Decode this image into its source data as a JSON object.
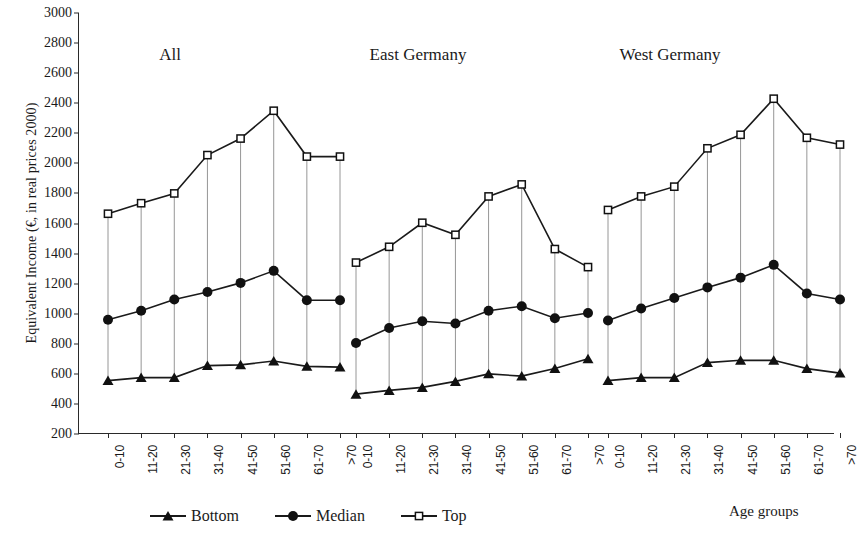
{
  "chart_data": {
    "type": "line",
    "title": "",
    "xlabel": "Age groups",
    "ylabel": "Equivalent Income (€, in real prices 2000)",
    "ylim": [
      200,
      3000
    ],
    "ytick_step": 200,
    "yticks": [
      3000,
      2800,
      2600,
      2400,
      2200,
      2000,
      1800,
      1600,
      1400,
      1200,
      1000,
      800,
      600,
      400,
      200
    ],
    "grid": false,
    "legend_position": "bottom-left",
    "categories": [
      "0-10",
      "11-20",
      "21-30",
      "31-40",
      "41-50",
      "51-60",
      "61-70",
      ">70"
    ],
    "panels": [
      {
        "name": "All",
        "series": [
          {
            "name": "Bottom",
            "marker": "triangle",
            "values": [
              555,
              575,
              575,
              655,
              660,
              685,
              650,
              645
            ]
          },
          {
            "name": "Median",
            "marker": "circle",
            "values": [
              960,
              1020,
              1095,
              1145,
              1205,
              1285,
              1090,
              1090
            ]
          },
          {
            "name": "Top",
            "marker": "square",
            "values": [
              1665,
              1735,
              1800,
              2055,
              2165,
              2350,
              2045,
              2045
            ]
          }
        ]
      },
      {
        "name": "East Germany",
        "series": [
          {
            "name": "Bottom",
            "marker": "triangle",
            "values": [
              465,
              490,
              510,
              550,
              600,
              585,
              635,
              700
            ]
          },
          {
            "name": "Median",
            "marker": "circle",
            "values": [
              805,
              905,
              950,
              935,
              1020,
              1050,
              970,
              1005
            ]
          },
          {
            "name": "Top",
            "marker": "square",
            "values": [
              1340,
              1445,
              1605,
              1525,
              1780,
              1860,
              1430,
              1310
            ]
          }
        ]
      },
      {
        "name": "West Germany",
        "series": [
          {
            "name": "Bottom",
            "marker": "triangle",
            "values": [
              555,
              575,
              575,
              675,
              690,
              690,
              635,
              605
            ]
          },
          {
            "name": "Median",
            "marker": "circle",
            "values": [
              955,
              1035,
              1105,
              1175,
              1240,
              1325,
              1135,
              1095
            ]
          },
          {
            "name": "Top",
            "marker": "square",
            "values": [
              1690,
              1780,
              1845,
              2100,
              2190,
              2430,
              2170,
              2125
            ]
          }
        ]
      }
    ],
    "legend": [
      {
        "label": "Bottom",
        "marker": "triangle"
      },
      {
        "label": "Median",
        "marker": "circle"
      },
      {
        "label": "Top",
        "marker": "square"
      }
    ],
    "colors": {
      "line": "#1a1a1a",
      "marker_fill": "#111111",
      "open_marker_fill": "#ffffff",
      "connector": "#8a8a8a",
      "axis": "#2a2a2a",
      "background": "#ffffff"
    }
  }
}
